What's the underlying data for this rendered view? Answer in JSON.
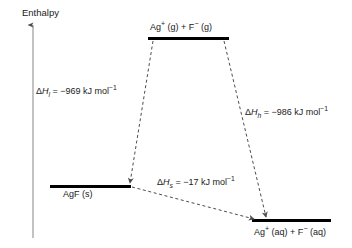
{
  "diagram": {
    "type": "energy-level-diagram",
    "axis": {
      "label": "Enthalpy",
      "direction": "up"
    },
    "levels": [
      {
        "id": "gaseous-ions",
        "label_html": "Ag<sup>+</sup> (g) + F<sup>−</sup> (g)",
        "label_text": "Ag+ (g) + F- (g)"
      },
      {
        "id": "solid-salt",
        "label_html": "AgF (s)",
        "label_text": "AgF (s)"
      },
      {
        "id": "aqueous-ions",
        "label_html": "Ag<sup>+</sup> (aq) + F<sup>−</sup> (aq)",
        "label_text": "Ag+ (aq) + F- (aq)"
      }
    ],
    "transitions": [
      {
        "id": "lattice",
        "from": "gaseous-ions",
        "to": "solid-salt",
        "symbol_html": "Δ<i>H</i><sub>l</sub>",
        "value": "−969",
        "units_html": "kJ mol<sup>−1</sup>",
        "label_html": "Δ<i>H</i><sub>l</sub> = −969 kJ mol<sup>−1</sup>",
        "label_text": "ΔHl = −969 kJ mol−1"
      },
      {
        "id": "hydration",
        "from": "gaseous-ions",
        "to": "aqueous-ions",
        "symbol_html": "Δ<i>H</i><sub>h</sub>",
        "value": "−986",
        "units_html": "kJ mol<sup>−1</sup>",
        "label_html": "Δ<i>H</i><sub>h</sub> = −986 kJ mol<sup>−1</sup>",
        "label_text": "ΔHh = −986 kJ mol−1"
      },
      {
        "id": "solution",
        "from": "solid-salt",
        "to": "aqueous-ions",
        "symbol_html": "Δ<i>H</i><sub>s</sub>",
        "value": "−17",
        "units_html": "kJ mol<sup>−1</sup>",
        "label_html": "Δ<i>H</i><sub>s</sub> = −17 kJ mol<sup>−1</sup>",
        "label_text": "ΔHs = −17 kJ mol−1"
      }
    ],
    "colors": {
      "ink": "#1a1a1a",
      "level_bar": "#000000",
      "axis": "#8a8a8a",
      "dashed": "#4d4d4d",
      "background": "#ffffff"
    }
  }
}
